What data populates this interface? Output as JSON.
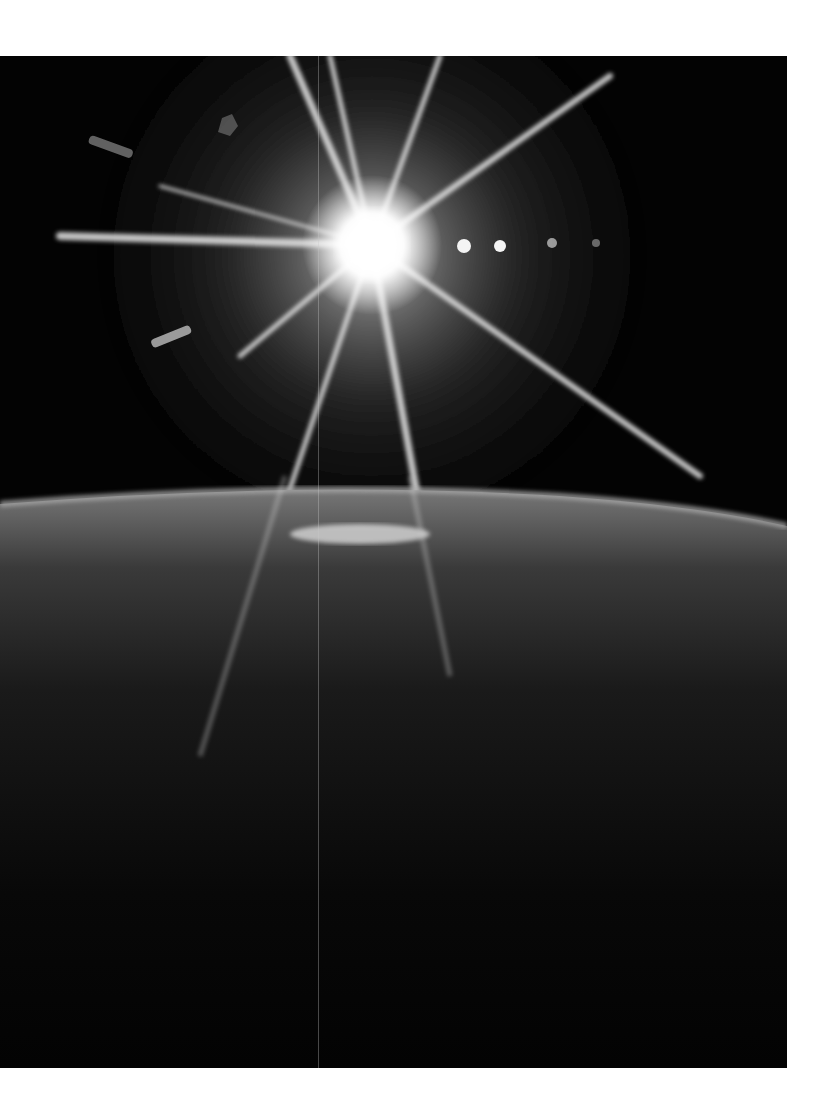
{
  "page": {
    "background": "#ffffff",
    "caption": ""
  },
  "photo": {
    "subject": "sunburst-over-earth-horizon",
    "tone": "black-and-white",
    "sun": {
      "x": 372,
      "y": 189,
      "color": "#ffffff"
    },
    "lens_flares": [
      {
        "x": 464,
        "y": 190,
        "r": 7
      },
      {
        "x": 500,
        "y": 190,
        "r": 6
      },
      {
        "x": 552,
        "y": 187,
        "r": 5
      },
      {
        "x": 596,
        "y": 187,
        "r": 4
      }
    ],
    "horizon_y": 440,
    "colors": {
      "space": "#030303",
      "atmosphere_glow": "#9a9a9a",
      "earth_limb": "#6e6e6e",
      "earth_dark": "#1a1a1a"
    }
  }
}
